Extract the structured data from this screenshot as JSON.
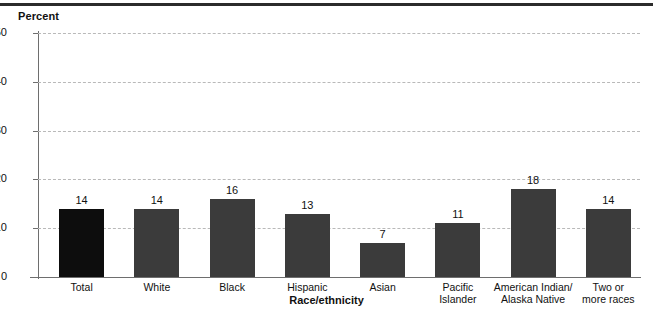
{
  "chart_data": {
    "type": "bar",
    "title": "",
    "subtitle": "",
    "xlabel": "Race/ethnicity",
    "ylabel": "Percent",
    "ylim": [
      0,
      50
    ],
    "yticks": [
      0,
      10,
      20,
      30,
      40,
      50
    ],
    "ytick_labels": [
      "0",
      "10",
      "20",
      "30",
      "40",
      "50"
    ],
    "grid": true,
    "grid_style": "dashed-horizontal",
    "legend": "none",
    "categories": [
      "Total",
      "White",
      "Black",
      "Hispanic",
      "Asian",
      "Pacific Islander",
      "American Indian/ Alaska Native",
      "Two or more races"
    ],
    "category_lines": [
      [
        "Total"
      ],
      [
        "White"
      ],
      [
        "Black"
      ],
      [
        "Hispanic"
      ],
      [
        "Asian"
      ],
      [
        "Pacific",
        "Islander"
      ],
      [
        "American Indian/",
        "Alaska Native"
      ],
      [
        "Two or",
        "more races"
      ]
    ],
    "values": [
      14,
      14,
      16,
      13,
      7,
      11,
      18,
      14
    ],
    "value_labels": [
      "14",
      "14",
      "16",
      "13",
      "7",
      "11",
      "18",
      "14"
    ],
    "bar_colors": [
      "#0d0d0d",
      "#3b3b3b",
      "#3b3b3b",
      "#3b3b3b",
      "#3b3b3b",
      "#3b3b3b",
      "#3b3b3b",
      "#3b3b3b"
    ],
    "highlight_category": "Total"
  },
  "colors": {
    "bar_default": "#3b3b3b",
    "bar_highlight": "#0d0d0d",
    "gridline": "#b9b9b9",
    "axis": "#6e6e6e",
    "rule": "#2b2b2b",
    "text": "#111111",
    "background": "#ffffff"
  }
}
